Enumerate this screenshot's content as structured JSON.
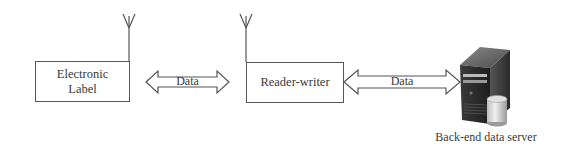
{
  "diagram": {
    "nodes": [
      {
        "id": "electronic-label",
        "label": "Electronic\nLabel",
        "line1": "Electronic",
        "line2": "Label",
        "has_antenna": true
      },
      {
        "id": "reader-writer",
        "label": "Reader-writer",
        "has_antenna": true
      },
      {
        "id": "backend-server",
        "label": "Back-end data server",
        "icon": "server-with-database-icon"
      }
    ],
    "edges": [
      {
        "from": "electronic-label",
        "to": "reader-writer",
        "label": "Data",
        "direction": "bidirectional"
      },
      {
        "from": "reader-writer",
        "to": "backend-server",
        "label": "Data",
        "direction": "bidirectional"
      }
    ]
  }
}
